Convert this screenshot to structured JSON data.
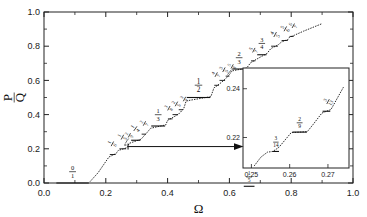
{
  "figure": {
    "title": "",
    "axis": {
      "xlabel": "Ω",
      "ylabel_numerator": "P",
      "ylabel_denominator": "Q",
      "xticks": [
        "0.0",
        "0.2",
        "0.4",
        "0.6",
        "0.8",
        "1.0"
      ],
      "yticks": [
        "0.0",
        "0.2",
        "0.4",
        "0.6",
        "0.8",
        "1.0"
      ]
    },
    "inset": {
      "xticks": [
        "0.25",
        "0.26",
        "0.27"
      ],
      "yticks": [
        "0.22",
        "0.24"
      ],
      "xlim": [
        0.2478,
        0.2755
      ],
      "ylim": [
        0.2075,
        0.2485
      ]
    },
    "connector": {
      "name": "inset-pointer-arrow",
      "label": ""
    }
  },
  "chart_data": {
    "type": "line",
    "title": "",
    "xlabel": "Ω",
    "ylabel": "P/Q",
    "xlim": [
      0.0,
      1.0
    ],
    "ylim": [
      0.0,
      1.0
    ],
    "grid": false,
    "legend": null,
    "main_plateaus": [
      {
        "label": "0/1",
        "p": 0,
        "q": 1,
        "value": 0.0,
        "x_start": 0.04,
        "x_end": 0.145
      },
      {
        "label": "1/6",
        "p": 1,
        "q": 6,
        "value": 0.166666,
        "x_start": 0.213,
        "x_end": 0.232
      },
      {
        "label": "1/5",
        "p": 1,
        "q": 5,
        "value": 0.2,
        "x_start": 0.244,
        "x_end": 0.266
      },
      {
        "label": "2/9",
        "p": 2,
        "q": 9,
        "value": 0.222222,
        "x_start": 0.2595,
        "x_end": 0.2665
      },
      {
        "label": "1/4",
        "p": 1,
        "q": 4,
        "value": 0.25,
        "x_start": 0.282,
        "x_end": 0.312
      },
      {
        "label": "2/7",
        "p": 2,
        "q": 7,
        "value": 0.285714,
        "x_start": 0.316,
        "x_end": 0.33
      },
      {
        "label": "1/3",
        "p": 1,
        "q": 3,
        "value": 0.333333,
        "x_start": 0.347,
        "x_end": 0.392
      },
      {
        "label": "3/8",
        "p": 3,
        "q": 8,
        "value": 0.375,
        "x_start": 0.401,
        "x_end": 0.416
      },
      {
        "label": "2/5",
        "p": 2,
        "q": 5,
        "value": 0.4,
        "x_start": 0.416,
        "x_end": 0.434
      },
      {
        "label": "3/7",
        "p": 3,
        "q": 7,
        "value": 0.428571,
        "x_start": 0.436,
        "x_end": 0.45
      },
      {
        "label": "1/2",
        "p": 1,
        "q": 2,
        "value": 0.5,
        "x_start": 0.462,
        "x_end": 0.538
      },
      {
        "label": "4/7",
        "p": 4,
        "q": 7,
        "value": 0.571428,
        "x_start": 0.551,
        "x_end": 0.566
      },
      {
        "label": "3/5",
        "p": 3,
        "q": 5,
        "value": 0.6,
        "x_start": 0.568,
        "x_end": 0.586
      },
      {
        "label": "5/8",
        "p": 5,
        "q": 8,
        "value": 0.625,
        "x_start": 0.588,
        "x_end": 0.6
      },
      {
        "label": "2/3",
        "p": 2,
        "q": 3,
        "value": 0.666666,
        "x_start": 0.609,
        "x_end": 0.654
      },
      {
        "label": "5/7",
        "p": 5,
        "q": 7,
        "value": 0.714285,
        "x_start": 0.67,
        "x_end": 0.684
      },
      {
        "label": "3/4",
        "p": 3,
        "q": 4,
        "value": 0.75,
        "x_start": 0.69,
        "x_end": 0.72
      },
      {
        "label": "4/5",
        "p": 4,
        "q": 5,
        "value": 0.8,
        "x_start": 0.735,
        "x_end": 0.757
      },
      {
        "label": "5/6",
        "p": 5,
        "q": 6,
        "value": 0.833333,
        "x_start": 0.769,
        "x_end": 0.789
      },
      {
        "label": "6/7",
        "p": 6,
        "q": 7,
        "value": 0.857142,
        "x_start": 0.795,
        "x_end": 0.808
      }
    ],
    "inset_plateaus": [
      {
        "label": "1/5",
        "p": 1,
        "q": 5,
        "value": 0.2,
        "x_start": 0.248,
        "x_end": 0.2508
      },
      {
        "label": "3/14",
        "p": 3,
        "q": 14,
        "value": 0.214285,
        "x_start": 0.2556,
        "x_end": 0.2572
      },
      {
        "label": "2/9",
        "p": 2,
        "q": 9,
        "value": 0.222222,
        "x_start": 0.2607,
        "x_end": 0.2645
      },
      {
        "label": "3/13",
        "p": 3,
        "q": 13,
        "value": 0.230769,
        "x_start": 0.2686,
        "x_end": 0.2706
      }
    ],
    "main_dotted_path": [
      [
        0.15,
        0.01
      ],
      [
        0.175,
        0.06
      ],
      [
        0.196,
        0.115
      ],
      [
        0.21,
        0.152
      ],
      [
        0.233,
        0.172
      ],
      [
        0.24,
        0.19
      ],
      [
        0.268,
        0.206
      ],
      [
        0.276,
        0.232
      ],
      [
        0.314,
        0.256
      ],
      [
        0.332,
        0.292
      ],
      [
        0.345,
        0.32
      ],
      [
        0.394,
        0.34
      ],
      [
        0.4,
        0.366
      ],
      [
        0.435,
        0.402
      ],
      [
        0.452,
        0.434
      ],
      [
        0.46,
        0.48
      ],
      [
        0.54,
        0.505
      ],
      [
        0.55,
        0.556
      ],
      [
        0.567,
        0.578
      ],
      [
        0.587,
        0.608
      ],
      [
        0.602,
        0.638
      ],
      [
        0.607,
        0.655
      ],
      [
        0.656,
        0.672
      ],
      [
        0.668,
        0.702
      ],
      [
        0.686,
        0.722
      ],
      [
        0.722,
        0.758
      ],
      [
        0.734,
        0.786
      ],
      [
        0.758,
        0.808
      ],
      [
        0.768,
        0.824
      ],
      [
        0.79,
        0.84
      ],
      [
        0.794,
        0.852
      ],
      [
        0.81,
        0.864
      ],
      [
        0.84,
        0.888
      ],
      [
        0.87,
        0.91
      ],
      [
        0.9,
        0.932
      ]
    ],
    "inset_dotted_path": [
      [
        0.2508,
        0.2085
      ],
      [
        0.2525,
        0.212
      ],
      [
        0.2542,
        0.214
      ],
      [
        0.2556,
        0.2143
      ],
      [
        0.2572,
        0.216
      ],
      [
        0.2588,
        0.219
      ],
      [
        0.2604,
        0.222
      ],
      [
        0.2646,
        0.2224
      ],
      [
        0.2662,
        0.2255
      ],
      [
        0.2684,
        0.23
      ],
      [
        0.2708,
        0.2315
      ],
      [
        0.2724,
        0.236
      ],
      [
        0.274,
        0.2405
      ]
    ]
  }
}
